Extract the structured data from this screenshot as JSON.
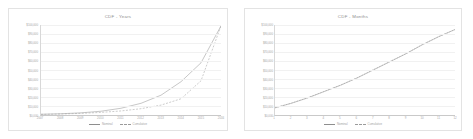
{
  "charts": [
    {
      "id": "cdf-years",
      "title": "CDF - Years",
      "legend": [
        {
          "label": "Nominal",
          "style": "solid"
        },
        {
          "label": "Cumulative",
          "style": "dashed"
        }
      ]
    },
    {
      "id": "cdf-months",
      "title": "CDF - Months",
      "legend": [
        {
          "label": "Nominal",
          "style": "solid"
        },
        {
          "label": "Cumulative",
          "style": "dashed"
        }
      ]
    }
  ],
  "chart_data": [
    {
      "type": "line",
      "title": "CDF - Years",
      "xlabel": "",
      "ylabel": "",
      "grid": true,
      "legend_position": "bottom",
      "categories": [
        "2007",
        "2008",
        "2009",
        "2010",
        "2011",
        "2012",
        "2013",
        "2014",
        "2015",
        "2016"
      ],
      "x": [
        2007,
        2008,
        2009,
        2010,
        2011,
        2012,
        2013,
        2014,
        2015,
        2016
      ],
      "ylim": [
        0,
        100000
      ],
      "yticks": [
        0,
        10000,
        20000,
        30000,
        40000,
        50000,
        60000,
        70000,
        80000,
        90000,
        100000
      ],
      "ytick_labels": [
        "$0,000",
        "$10,000",
        "$20,000",
        "$30,000",
        "$40,000",
        "$50,000",
        "$60,000",
        "$70,000",
        "$80,000",
        "$90,000",
        "$100,000"
      ],
      "series": [
        {
          "name": "Nominal",
          "style": "solid",
          "values": [
            800,
            1400,
            2400,
            4200,
            7500,
            13000,
            22000,
            37000,
            58000,
            99000
          ]
        },
        {
          "name": "Cumulative",
          "style": "dashed",
          "values": [
            700,
            1100,
            1800,
            2900,
            4500,
            7000,
            11000,
            18000,
            38000,
            99000
          ]
        }
      ]
    },
    {
      "type": "line",
      "title": "CDF - Months",
      "xlabel": "",
      "ylabel": "",
      "grid": true,
      "legend_position": "bottom",
      "categories": [
        "1",
        "2",
        "3",
        "4",
        "5",
        "6",
        "7",
        "8",
        "9",
        "10",
        "11",
        "12"
      ],
      "x": [
        1,
        2,
        3,
        4,
        5,
        6,
        7,
        8,
        9,
        10,
        11,
        12
      ],
      "ylim": [
        0,
        100000
      ],
      "yticks": [
        0,
        10000,
        20000,
        30000,
        40000,
        50000,
        60000,
        70000,
        80000,
        90000,
        100000
      ],
      "ytick_labels": [
        "$0,000",
        "$10,000",
        "$20,000",
        "$30,000",
        "$40,000",
        "$50,000",
        "$60,000",
        "$70,000",
        "$80,000",
        "$90,000",
        "$100,000"
      ],
      "series": [
        {
          "name": "Nominal",
          "style": "solid",
          "values": [
            8000,
            13000,
            19000,
            26000,
            33000,
            41000,
            50000,
            59000,
            68000,
            78000,
            87000,
            95000
          ]
        },
        {
          "name": "Cumulative",
          "style": "dashed",
          "values": [
            8000,
            13200,
            19200,
            26200,
            33200,
            41200,
            50200,
            59200,
            68200,
            78200,
            87000,
            95000
          ]
        }
      ]
    }
  ]
}
